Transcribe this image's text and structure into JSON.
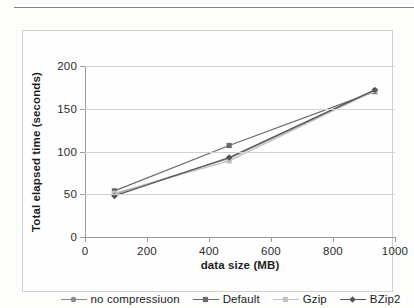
{
  "chart_data": {
    "type": "line",
    "title": "",
    "xlabel": "data size (MB)",
    "ylabel": "Total elapsed time (seconds)",
    "xlim": [
      0,
      1000
    ],
    "ylim": [
      0,
      200
    ],
    "xticks": [
      0,
      200,
      400,
      600,
      800,
      1000
    ],
    "yticks": [
      0,
      50,
      100,
      150,
      200
    ],
    "grid": "horizontal",
    "legend_position": "bottom",
    "x": [
      95,
      465,
      935
    ],
    "series": [
      {
        "name": "no compressiuon",
        "marker": "circle",
        "color": "#8a8a8a",
        "values": [
          50,
          92,
          171
        ]
      },
      {
        "name": "Default",
        "marker": "square",
        "color": "#6b6b6b",
        "values": [
          54,
          107,
          170
        ]
      },
      {
        "name": "Gzip",
        "marker": "square",
        "color": "#c0c0c0",
        "values": [
          51,
          89,
          171
        ]
      },
      {
        "name": "BZip2",
        "marker": "diamond",
        "color": "#555555",
        "values": [
          48,
          93,
          172
        ]
      }
    ]
  },
  "axes": {
    "x_tick_labels": [
      "0",
      "200",
      "400",
      "600",
      "800",
      "1000"
    ],
    "y_tick_labels": [
      "0",
      "50",
      "100",
      "150",
      "200"
    ],
    "x_title": "data size (MB)",
    "y_title": "Total elapsed time (seconds)"
  },
  "legend": {
    "items": [
      {
        "label": "no compressiuon"
      },
      {
        "label": "Default"
      },
      {
        "label": "Gzip"
      },
      {
        "label": "BZip2"
      }
    ]
  }
}
